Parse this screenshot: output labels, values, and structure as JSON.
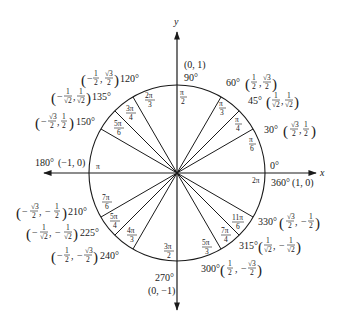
{
  "axes": {
    "x_label": "x",
    "y_label": "y"
  },
  "geometry": {
    "cx": 177,
    "cy": 173,
    "r": 88
  },
  "colors": {
    "ink": "#1a1a1a",
    "background": "#ffffff"
  },
  "angles": [
    {
      "deg": "0°",
      "rad": "",
      "point": "",
      "extra": "0°"
    },
    {
      "deg": "30°",
      "rad_num": "π",
      "rad_den": "6",
      "x_num": "√3",
      "x_den": "2",
      "x_sign": "",
      "y_num": "1",
      "y_den": "2",
      "y_sign": ""
    },
    {
      "deg": "45°",
      "rad_num": "π",
      "rad_den": "4",
      "x_num": "1",
      "x_den": "√2",
      "x_sign": "",
      "y_num": "1",
      "y_den": "√2",
      "y_sign": ""
    },
    {
      "deg": "60°",
      "rad_num": "π",
      "rad_den": "3",
      "x_num": "1",
      "x_den": "2",
      "x_sign": "",
      "y_num": "√3",
      "y_den": "2",
      "y_sign": ""
    },
    {
      "deg": "90°",
      "rad_num": "π",
      "rad_den": "2",
      "point": "(0, 1)"
    },
    {
      "deg": "120°",
      "rad_num": "2π",
      "rad_den": "3",
      "x_num": "1",
      "x_den": "2",
      "x_sign": "−",
      "y_num": "√3",
      "y_den": "2",
      "y_sign": ""
    },
    {
      "deg": "135°",
      "rad_num": "3π",
      "rad_den": "4",
      "x_num": "1",
      "x_den": "√2",
      "x_sign": "−",
      "y_num": "1",
      "y_den": "√2",
      "y_sign": ""
    },
    {
      "deg": "150°",
      "rad_num": "5π",
      "rad_den": "6",
      "x_num": "√3",
      "x_den": "2",
      "x_sign": "−",
      "y_num": "1",
      "y_den": "2",
      "y_sign": ""
    },
    {
      "deg": "180°",
      "rad": "π",
      "point": "(−1, 0)"
    },
    {
      "deg": "210°",
      "rad_num": "7π",
      "rad_den": "6",
      "x_num": "√3",
      "x_den": "2",
      "x_sign": "−",
      "y_num": "1",
      "y_den": "2",
      "y_sign": "−"
    },
    {
      "deg": "225°",
      "rad_num": "5π",
      "rad_den": "4",
      "x_num": "1",
      "x_den": "√2",
      "x_sign": "−",
      "y_num": "1",
      "y_den": "√2",
      "y_sign": "−"
    },
    {
      "deg": "240°",
      "rad_num": "4π",
      "rad_den": "3",
      "x_num": "1",
      "x_den": "2",
      "x_sign": "−",
      "y_num": "√3",
      "y_den": "2",
      "y_sign": "−"
    },
    {
      "deg": "270°",
      "rad_num": "3π",
      "rad_den": "2",
      "point": "(0, −1)"
    },
    {
      "deg": "300°",
      "rad_num": "5π",
      "rad_den": "3",
      "x_num": "1",
      "x_den": "2",
      "x_sign": "",
      "y_num": "√3",
      "y_den": "2",
      "y_sign": "−"
    },
    {
      "deg": "315°",
      "rad_num": "7π",
      "rad_den": "4",
      "x_num": "1",
      "x_den": "√2",
      "x_sign": "",
      "y_num": "1",
      "y_den": "√2",
      "y_sign": "−"
    },
    {
      "deg": "330°",
      "rad_num": "11π",
      "rad_den": "6",
      "x_num": "√3",
      "x_den": "2",
      "x_sign": "",
      "y_num": "1",
      "y_den": "2",
      "y_sign": "−"
    },
    {
      "deg": "360°",
      "rad": "2π",
      "point": "(1, 0)"
    }
  ],
  "glyphs": {
    "lparen": "(",
    "rparen": ")",
    "comma": ",",
    "minus": "−"
  }
}
